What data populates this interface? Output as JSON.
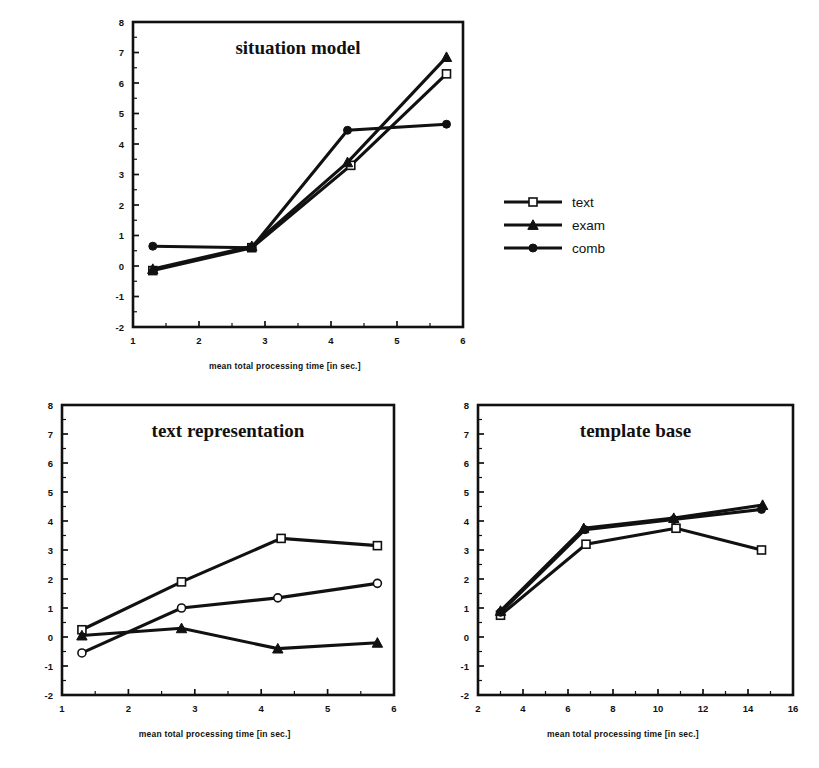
{
  "figure": {
    "background": "#ffffff",
    "ink_color": "#111111"
  },
  "legend": {
    "position": "middle-right",
    "entries": [
      {
        "label": "text",
        "marker": "square-open"
      },
      {
        "label": "exam",
        "marker": "triangle-filled"
      },
      {
        "label": "comb",
        "marker": "circle-filled"
      }
    ]
  },
  "axis_title": "mean total processing time [in sec.]",
  "panels": [
    {
      "id": "situation-model",
      "title": "situation model",
      "xlabel": "mean total processing time [in sec.]",
      "ylabel": "",
      "xlim": [
        1,
        6
      ],
      "ylim": [
        -2,
        8
      ],
      "xticks": [
        1,
        2,
        3,
        4,
        5,
        6
      ],
      "yticks": [
        -2,
        -1,
        0,
        1,
        2,
        3,
        4,
        5,
        6,
        7,
        8
      ],
      "grid": false
    },
    {
      "id": "text-representation",
      "title": "text representation",
      "xlabel": "mean total processing time [in sec.]",
      "ylabel": "",
      "xlim": [
        1,
        6
      ],
      "ylim": [
        -2,
        8
      ],
      "xticks": [
        1,
        2,
        3,
        4,
        5,
        6
      ],
      "yticks": [
        -2,
        -1,
        0,
        1,
        2,
        3,
        4,
        5,
        6,
        7,
        8
      ],
      "grid": false
    },
    {
      "id": "template-base",
      "title": "template base",
      "xlabel": "mean total processing time [in sec.]",
      "ylabel": "",
      "xlim": [
        2,
        16
      ],
      "ylim": [
        -2,
        8
      ],
      "xticks": [
        2,
        4,
        6,
        8,
        10,
        12,
        14,
        16
      ],
      "yticks": [
        -2,
        -1,
        0,
        1,
        2,
        3,
        4,
        5,
        6,
        7,
        8
      ],
      "grid": false
    }
  ],
  "chart_data": [
    {
      "type": "line",
      "title": "situation model",
      "xlabel": "mean total processing time [in sec.]",
      "ylabel": "",
      "xlim": [
        1,
        6
      ],
      "ylim": [
        -2,
        8
      ],
      "xticks": [
        1,
        2,
        3,
        4,
        5,
        6
      ],
      "yticks": [
        -2,
        -1,
        0,
        1,
        2,
        3,
        4,
        5,
        6,
        7,
        8
      ],
      "grid": false,
      "legend_position": "outside-right",
      "series": [
        {
          "name": "text",
          "marker": "square-open",
          "x": [
            1.3,
            2.8,
            4.3,
            5.75
          ],
          "y": [
            -0.15,
            0.6,
            3.3,
            6.3
          ]
        },
        {
          "name": "exam",
          "marker": "triangle-filled",
          "x": [
            1.3,
            2.8,
            4.25,
            5.75
          ],
          "y": [
            -0.1,
            0.65,
            3.4,
            6.85
          ]
        },
        {
          "name": "comb",
          "marker": "circle-filled",
          "x": [
            1.3,
            2.8,
            4.25,
            5.75
          ],
          "y": [
            0.65,
            0.6,
            4.45,
            4.65
          ]
        }
      ]
    },
    {
      "type": "line",
      "title": "text representation",
      "xlabel": "mean total processing time [in sec.]",
      "ylabel": "",
      "xlim": [
        1,
        6
      ],
      "ylim": [
        -2,
        8
      ],
      "xticks": [
        1,
        2,
        3,
        4,
        5,
        6
      ],
      "yticks": [
        -2,
        -1,
        0,
        1,
        2,
        3,
        4,
        5,
        6,
        7,
        8
      ],
      "grid": false,
      "legend_position": "none",
      "series": [
        {
          "name": "text",
          "marker": "square-open",
          "x": [
            1.3,
            2.8,
            4.3,
            5.75
          ],
          "y": [
            0.25,
            1.9,
            3.4,
            3.15
          ]
        },
        {
          "name": "exam",
          "marker": "triangle-filled",
          "x": [
            1.3,
            2.8,
            4.25,
            5.75
          ],
          "y": [
            0.05,
            0.3,
            -0.4,
            -0.2
          ]
        },
        {
          "name": "comb",
          "marker": "circle-open",
          "x": [
            1.3,
            2.8,
            4.25,
            5.75
          ],
          "y": [
            -0.55,
            1.0,
            1.35,
            1.85
          ]
        }
      ]
    },
    {
      "type": "line",
      "title": "template base",
      "xlabel": "mean total processing time [in sec.]",
      "ylabel": "",
      "xlim": [
        2,
        16
      ],
      "ylim": [
        -2,
        8
      ],
      "xticks": [
        2,
        4,
        6,
        8,
        10,
        12,
        14,
        16
      ],
      "yticks": [
        -2,
        -1,
        0,
        1,
        2,
        3,
        4,
        5,
        6,
        7,
        8
      ],
      "grid": false,
      "legend_position": "none",
      "series": [
        {
          "name": "text",
          "marker": "square-open",
          "x": [
            3.0,
            6.8,
            10.8,
            14.6
          ],
          "y": [
            0.75,
            3.2,
            3.75,
            3.0
          ]
        },
        {
          "name": "exam",
          "marker": "triangle-filled",
          "x": [
            3.0,
            6.7,
            10.7,
            14.65
          ],
          "y": [
            0.9,
            3.75,
            4.1,
            4.55
          ]
        },
        {
          "name": "comb",
          "marker": "circle-filled",
          "x": [
            3.0,
            6.75,
            10.7,
            14.6
          ],
          "y": [
            0.85,
            3.7,
            4.05,
            4.4
          ]
        }
      ]
    }
  ]
}
